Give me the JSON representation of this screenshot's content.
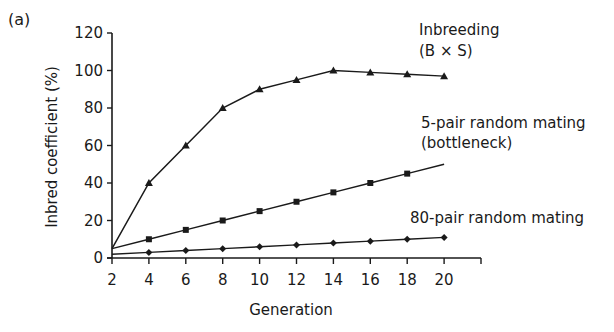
{
  "panel_label": "(a)",
  "chart_data": {
    "type": "line",
    "title": "",
    "xlabel": "Generation",
    "ylabel": "Inbred coefficient (%)",
    "x": [
      2,
      4,
      6,
      8,
      10,
      12,
      14,
      16,
      18,
      20
    ],
    "xticks": [
      2,
      4,
      6,
      8,
      10,
      12,
      14,
      16,
      18,
      20
    ],
    "xlim": [
      2,
      22
    ],
    "yticks": [
      0,
      20,
      40,
      60,
      80,
      100,
      120
    ],
    "ylim": [
      0,
      120
    ],
    "grid": false,
    "legend": "inline labels at right of lines",
    "series": [
      {
        "name": "Inbreeding (B × S)",
        "label_lines": [
          "Inbreeding",
          "(B × S)"
        ],
        "marker": "triangle",
        "values": [
          5,
          40,
          60,
          80,
          90,
          95,
          100,
          99,
          98,
          97
        ]
      },
      {
        "name": "5-pair random mating (bottleneck)",
        "label_lines": [
          "5-pair random mating",
          "(bottleneck)"
        ],
        "marker": "square",
        "values": [
          5,
          10,
          15,
          20,
          25,
          30,
          35,
          40,
          45,
          50
        ]
      },
      {
        "name": "80-pair random mating",
        "label_lines": [
          "80-pair random mating"
        ],
        "marker": "diamond",
        "values": [
          2,
          3,
          4,
          5,
          6,
          7,
          8,
          9,
          10,
          11
        ]
      }
    ]
  }
}
